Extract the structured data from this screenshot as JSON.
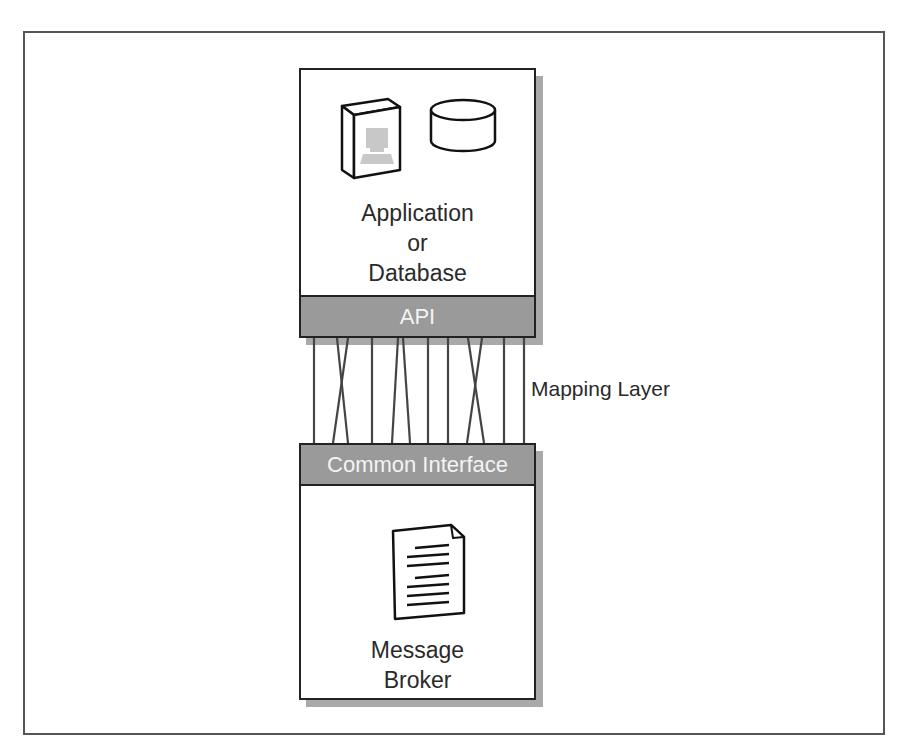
{
  "diagram": {
    "top_box": {
      "title_lines": [
        "Application",
        "or",
        "Database"
      ],
      "band_label": "API",
      "icons": [
        "application-book-icon",
        "database-cylinder-icon"
      ]
    },
    "mapping": {
      "label": "Mapping Layer"
    },
    "bottom_box": {
      "band_label": "Common Interface",
      "title_lines": [
        "Message",
        "Broker"
      ],
      "icons": [
        "document-icon"
      ]
    },
    "colors": {
      "band_fill": "#9a9a9a",
      "shadow": "#a9a9a9",
      "outline": "#222222",
      "band_text": "#f4f4f4"
    }
  }
}
